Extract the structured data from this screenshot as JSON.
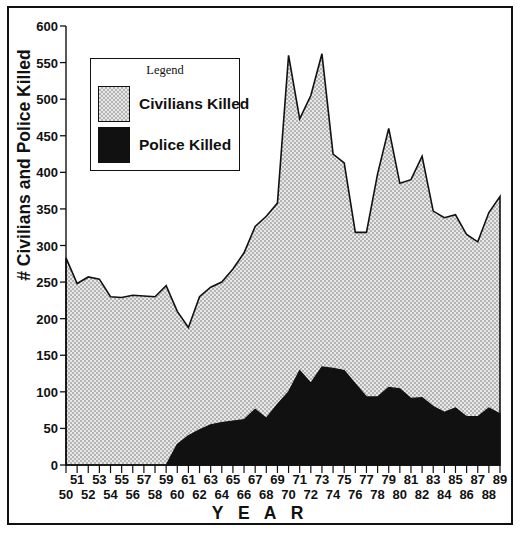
{
  "chart_data": {
    "type": "area",
    "stacked": true,
    "title": "",
    "xlabel": "Y E A R",
    "ylabel": "# Civilians and Police Killed",
    "ylim": [
      0,
      600
    ],
    "ytick_step": 50,
    "yticks": [
      0,
      50,
      100,
      150,
      200,
      250,
      300,
      350,
      400,
      450,
      500,
      550,
      600
    ],
    "xlim": [
      50,
      89
    ],
    "grid": false,
    "legend": {
      "title": "Legend",
      "position": "upper-left-inside",
      "entries": [
        {
          "name": "Civilians Killed",
          "color": "#d0d0d0",
          "pattern": "light-stipple"
        },
        {
          "name": "Police Killed",
          "color": "#111111",
          "pattern": "solid-black"
        }
      ]
    },
    "x": [
      50,
      51,
      52,
      53,
      54,
      55,
      56,
      57,
      58,
      59,
      60,
      61,
      62,
      63,
      64,
      65,
      66,
      67,
      68,
      69,
      70,
      71,
      72,
      73,
      74,
      75,
      76,
      77,
      78,
      79,
      80,
      81,
      82,
      83,
      84,
      85,
      86,
      87,
      88,
      89
    ],
    "xtick_labels": [
      "50",
      "51",
      "52",
      "53",
      "54",
      "55",
      "56",
      "57",
      "58",
      "59",
      "60",
      "61",
      "62",
      "63",
      "64",
      "65",
      "66",
      "67",
      "68",
      "69",
      "70",
      "71",
      "72",
      "73",
      "74",
      "75",
      "76",
      "77",
      "78",
      "79",
      "80",
      "81",
      "82",
      "83",
      "84",
      "85",
      "86",
      "87",
      "88",
      "89"
    ],
    "series": [
      {
        "name": "Police Killed",
        "color": "#111111",
        "values": [
          0,
          0,
          0,
          0,
          0,
          0,
          0,
          0,
          0,
          0,
          28,
          40,
          48,
          55,
          58,
          60,
          62,
          76,
          64,
          83,
          100,
          129,
          112,
          134,
          132,
          129,
          111,
          93,
          93,
          106,
          104,
          91,
          92,
          80,
          72,
          78,
          66,
          66,
          78,
          70
        ]
      },
      {
        "name": "Civilians Killed",
        "color": "#d0d0d0",
        "values": [
          283,
          248,
          257,
          254,
          230,
          229,
          232,
          231,
          230,
          245,
          210,
          188,
          230,
          243,
          250,
          268,
          290,
          326,
          340,
          358,
          560,
          473,
          505,
          562,
          425,
          413,
          318,
          318,
          398,
          460,
          385,
          390,
          422,
          347,
          338,
          342,
          315,
          305,
          345,
          367
        ]
      }
    ],
    "totals_note": "Civilians Killed values are the stack tops (total # killed); Police Killed is the lower band."
  }
}
